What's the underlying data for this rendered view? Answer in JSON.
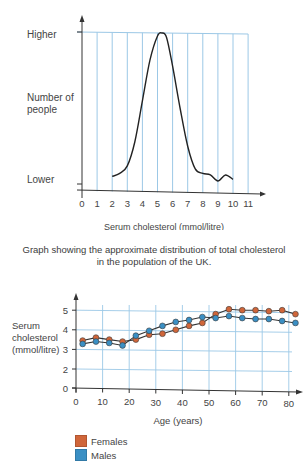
{
  "colors": {
    "grid": "#9cc8e6",
    "axis": "#333333",
    "curve": "#222222",
    "females": "#d0663a",
    "males": "#3a8fc4"
  },
  "chart_data": [
    {
      "type": "line",
      "title": "",
      "xlabel": "Serum cholesterol (mmol/litre)",
      "ylabel": "Number of people",
      "y_tick_labels": [
        "Lower",
        "Higher"
      ],
      "x_ticks": [
        0,
        1,
        2,
        3,
        4,
        5,
        6,
        7,
        8,
        9,
        10,
        11
      ],
      "xlim": [
        0,
        11
      ],
      "grid": true,
      "caption": "Graph showing the approximate distribution of total cholesterol in the population of the UK.",
      "series": [
        {
          "name": "Distribution",
          "x": [
            2.0,
            2.5,
            3.0,
            3.5,
            4.0,
            4.5,
            5.0,
            5.3,
            5.6,
            6.0,
            6.5,
            7.0,
            7.5,
            8.0,
            8.5,
            9.0,
            9.5,
            10.0
          ],
          "y": [
            0.05,
            0.07,
            0.12,
            0.28,
            0.55,
            0.82,
            0.98,
            1.0,
            0.97,
            0.78,
            0.5,
            0.25,
            0.1,
            0.07,
            0.06,
            0.02,
            0.06,
            0.03
          ]
        }
      ]
    },
    {
      "type": "line",
      "title": "",
      "xlabel": "Age (years)",
      "ylabel": "Serum cholesterol (mmol/litre)",
      "x_ticks": [
        0,
        10,
        20,
        30,
        40,
        50,
        60,
        70,
        80
      ],
      "y_ticks": [
        0,
        2,
        3,
        4,
        5
      ],
      "xlim": [
        0,
        85
      ],
      "ylim": [
        0,
        5.5
      ],
      "grid": true,
      "legend_position": "bottom-left",
      "x": [
        2.5,
        7.5,
        12.5,
        17.5,
        22.5,
        27.5,
        32.5,
        37.5,
        42.5,
        47.5,
        52.5,
        57.5,
        62.5,
        67.5,
        72.5,
        77.5,
        82.5
      ],
      "series": [
        {
          "name": "Females",
          "color": "#d0663a",
          "values": [
            3.45,
            3.6,
            3.5,
            3.4,
            3.5,
            3.75,
            3.8,
            4.0,
            4.2,
            4.35,
            4.8,
            5.05,
            5.0,
            5.0,
            4.95,
            5.0,
            4.8
          ]
        },
        {
          "name": "Males",
          "color": "#3a8fc4",
          "values": [
            3.28,
            3.4,
            3.33,
            3.2,
            3.7,
            3.95,
            4.2,
            4.4,
            4.5,
            4.65,
            4.6,
            4.7,
            4.6,
            4.55,
            4.55,
            4.45,
            4.35
          ]
        }
      ]
    }
  ],
  "top_chart": {
    "y_high_label": "Higher",
    "y_axis_label_line1": "Number of",
    "y_axis_label_line2": "people",
    "y_low_label": "Lower",
    "x_axis_label": "Serum cholesterol (mmol/litre)",
    "caption_line1": "Graph showing the approximate distribution of total cholesterol",
    "caption_line2": "in the population of the UK."
  },
  "bottom_chart": {
    "y_axis_label_line1": "Serum",
    "y_axis_label_line2": "cholesterol",
    "y_axis_label_line3": "(mmol/litre)",
    "x_axis_label": "Age (years)",
    "legend": [
      {
        "label": "Females",
        "color": "#d0663a"
      },
      {
        "label": "Males",
        "color": "#3a8fc4"
      }
    ]
  }
}
